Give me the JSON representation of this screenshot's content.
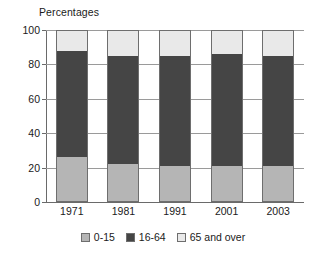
{
  "chart_data": {
    "type": "bar",
    "subtype": "stacked-100-percent",
    "title": "Percentages",
    "xlabel": "",
    "ylabel": "",
    "ylim": [
      0,
      100
    ],
    "yticks": [
      0,
      20,
      40,
      60,
      80,
      100
    ],
    "grid": true,
    "legend_position": "bottom-center",
    "categories": [
      "1971",
      "1981",
      "1991",
      "2001",
      "2003"
    ],
    "series": [
      {
        "name": "0-15",
        "color": "#b5b5b5",
        "values": [
          26,
          22,
          21,
          21,
          21
        ]
      },
      {
        "name": "16-64",
        "color": "#454545",
        "values": [
          62,
          63,
          64,
          65,
          64
        ]
      },
      {
        "name": "65 and over",
        "color": "#e9e9e9",
        "values": [
          12,
          15,
          15,
          14,
          15
        ]
      }
    ]
  },
  "axis": {
    "y_tick_labels": [
      "100",
      "80",
      "60",
      "40",
      "20",
      "0"
    ],
    "x_tick_labels": [
      "1971",
      "1981",
      "1991",
      "2001",
      "2003"
    ]
  },
  "legend": {
    "items": [
      {
        "label": "0-15",
        "color": "#b5b5b5"
      },
      {
        "label": "16-64",
        "color": "#454545"
      },
      {
        "label": "65 and over",
        "color": "#e9e9e9"
      }
    ]
  },
  "colors": {
    "axis": "#6a6a6a",
    "grid": "#9a9a9a",
    "text": "#1a1a1a",
    "background": "#ffffff",
    "series_0_15": "#b5b5b5",
    "series_16_64": "#454545",
    "series_65_over": "#e9e9e9"
  }
}
